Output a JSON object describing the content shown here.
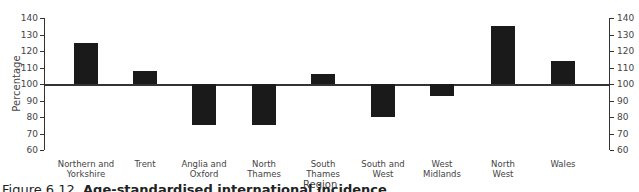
{
  "chart_data": {
    "type": "bar",
    "title": "",
    "xlabel": "Region",
    "ylabel": "Percentage",
    "ylim": [
      60,
      140
    ],
    "baseline": 100,
    "yticks": [
      140,
      130,
      120,
      110,
      100,
      90,
      80,
      70,
      60
    ],
    "categories": [
      "Northern and Yorkshire",
      "Trent",
      "Anglia and Oxford",
      "North Thames",
      "South Thames",
      "South and West",
      "West Midlands",
      "North West",
      "Wales"
    ],
    "category_lines": [
      [
        "Northern and",
        "Yorkshire"
      ],
      [
        "Trent",
        ""
      ],
      [
        "Anglia and",
        "Oxford"
      ],
      [
        "North",
        "Thames"
      ],
      [
        "South",
        "Thames"
      ],
      [
        "South and",
        "West"
      ],
      [
        "West",
        "Midlands"
      ],
      [
        "North",
        "West"
      ],
      [
        "Wales",
        ""
      ]
    ],
    "values": [
      125,
      108,
      75,
      75,
      106,
      80,
      93,
      135,
      114
    ],
    "bar_color": "#1a1a1a",
    "grid": false,
    "legend": null,
    "secondary_y_axis": true
  },
  "caption": {
    "prefix": "Figure 6.12",
    "bold": "Age-standardised international incidence"
  }
}
